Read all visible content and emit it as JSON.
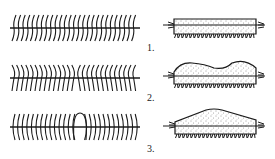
{
  "figure": {
    "rows": [
      {
        "label": "1.",
        "axis_pattern": "all bristles curved one direction",
        "body_shape": "flat rectangular block"
      },
      {
        "label": "2.",
        "axis_pattern": "bristles curve outward from both ends toward center",
        "body_shape": "humped / wavy top"
      },
      {
        "label": "3.",
        "axis_pattern": "bristles curve inward with central loop",
        "body_shape": "tapered / peaked top"
      }
    ],
    "colors": {
      "ink": "#1a1a1a",
      "background": "#ffffff"
    }
  }
}
